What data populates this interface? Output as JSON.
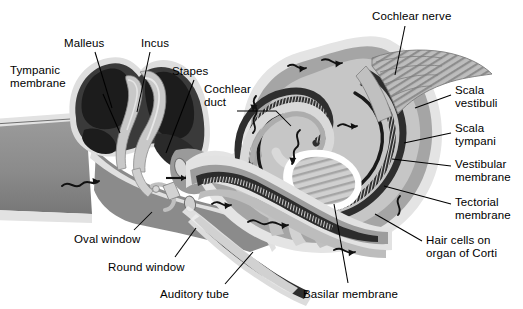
{
  "figure": {
    "type": "anatomical-diagram",
    "background_color": "#ffffff",
    "text_color": "#000000",
    "leader_line_color": "#000000"
  },
  "palette": {
    "white": "#ffffff",
    "bone_light": "#d9d9d9",
    "bone_pale": "#c9c9c9",
    "tissue_mid": "#a8a8a8",
    "tissue_gray": "#8f8f8f",
    "tissue_dark": "#6e6e6e",
    "cavity_dark": "#3a3a3a",
    "cavity_black": "#1e1e1e",
    "membrane_black": "#141414",
    "outline": "#5a5a5a"
  },
  "labels": [
    {
      "id": "tympanic-membrane",
      "text": "Tympanic\nmembrane",
      "x": 10,
      "y": 64,
      "align": "left"
    },
    {
      "id": "malleus",
      "text": "Malleus",
      "x": 64,
      "y": 37,
      "align": "left"
    },
    {
      "id": "incus",
      "text": "Incus",
      "x": 141,
      "y": 37,
      "align": "left"
    },
    {
      "id": "stapes",
      "text": "Stapes",
      "x": 172,
      "y": 65,
      "align": "left"
    },
    {
      "id": "cochlear-duct",
      "text": "Cochlear\nduct",
      "x": 204,
      "y": 83,
      "align": "left"
    },
    {
      "id": "cochlear-nerve",
      "text": "Cochlear nerve",
      "x": 372,
      "y": 10,
      "align": "left"
    },
    {
      "id": "scala-vestibuli",
      "text": "Scala\nvestibuli",
      "x": 455,
      "y": 84,
      "align": "left"
    },
    {
      "id": "scala-tympani",
      "text": "Scala\ntympani",
      "x": 455,
      "y": 122,
      "align": "left"
    },
    {
      "id": "vestibular-membrane",
      "text": "Vestibular\nmembrane",
      "x": 455,
      "y": 158,
      "align": "left"
    },
    {
      "id": "tectorial-membrane",
      "text": "Tectorial\nmembrane",
      "x": 455,
      "y": 196,
      "align": "left"
    },
    {
      "id": "hair-cells-organ-of-corti",
      "text": "Hair cells on\norgan of Corti",
      "x": 426,
      "y": 234,
      "align": "left"
    },
    {
      "id": "oval-window",
      "text": "Oval window",
      "x": 74,
      "y": 233,
      "align": "left"
    },
    {
      "id": "round-window",
      "text": "Round window",
      "x": 108,
      "y": 261,
      "align": "left"
    },
    {
      "id": "auditory-tube",
      "text": "Auditory tube",
      "x": 160,
      "y": 288,
      "align": "left"
    },
    {
      "id": "basilar-membrane",
      "text": "Basilar membrane",
      "x": 303,
      "y": 288,
      "align": "left"
    }
  ],
  "leaders": [
    {
      "id": "leader-tympanic-membrane",
      "points": "103,94 120,133"
    },
    {
      "id": "leader-malleus",
      "points": "95,52 112,108"
    },
    {
      "id": "leader-incus",
      "points": "150,52 137,112"
    },
    {
      "id": "leader-stapes",
      "points": "194,80 166,153"
    },
    {
      "id": "leader-cochlear-duct",
      "points": "237,111 276,111 291,126"
    },
    {
      "id": "leader-cochlear-nerve",
      "points": "405,26 395,75"
    },
    {
      "id": "leader-scala-vestibuli",
      "points": "451,95 415,108"
    },
    {
      "id": "leader-scala-tympani",
      "points": "451,133 404,143"
    },
    {
      "id": "leader-vestibular-membrane",
      "points": "451,166 392,159"
    },
    {
      "id": "leader-tectorial-membrane",
      "points": "451,204 384,186"
    },
    {
      "id": "leader-hair-cells",
      "points": "422,241 375,214"
    },
    {
      "id": "leader-oval-window",
      "points": "134,230 152,212"
    },
    {
      "id": "leader-round-window",
      "points": "175,257 196,228"
    },
    {
      "id": "leader-auditory-tube",
      "points": "225,284 253,252"
    },
    {
      "id": "leader-basilar-membrane",
      "points": "348,283 334,204"
    }
  ],
  "structures": [
    {
      "id": "external-auditory-canal",
      "name": "External auditory canal"
    },
    {
      "id": "tympanic-membrane-shape",
      "name": "Tympanic membrane"
    },
    {
      "id": "middle-ear-cavity",
      "name": "Middle ear cavity"
    },
    {
      "id": "malleus-shape",
      "name": "Malleus ossicle"
    },
    {
      "id": "incus-shape",
      "name": "Incus ossicle"
    },
    {
      "id": "stapes-shape",
      "name": "Stapes ossicle"
    },
    {
      "id": "oval-window-shape",
      "name": "Oval window"
    },
    {
      "id": "round-window-shape",
      "name": "Round window"
    },
    {
      "id": "auditory-tube-shape",
      "name": "Auditory tube"
    },
    {
      "id": "cochlea-spiral",
      "name": "Uncoiled cochlear spiral"
    },
    {
      "id": "scala-vestibuli-band",
      "name": "Scala vestibuli"
    },
    {
      "id": "scala-tympani-band",
      "name": "Scala tympani"
    },
    {
      "id": "cochlear-duct-band",
      "name": "Cochlear duct"
    },
    {
      "id": "basilar-membrane-band",
      "name": "Basilar membrane"
    },
    {
      "id": "cochlear-nerve-fan",
      "name": "Cochlear nerve"
    },
    {
      "id": "modiolus",
      "name": "Modiolus central core"
    },
    {
      "id": "fluid-flow-arrows",
      "name": "Perilymph fluid flow arrows"
    }
  ]
}
